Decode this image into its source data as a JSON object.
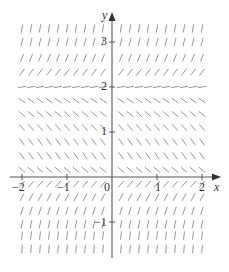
{
  "figure": {
    "type": "slope-field",
    "axes": {
      "x_label": "x",
      "y_label": "y",
      "x_ticks": [
        {
          "value": -2,
          "label": "−2"
        },
        {
          "value": -1,
          "label": "−1"
        },
        {
          "value": 0,
          "label": "0"
        },
        {
          "value": 1,
          "label": "1"
        },
        {
          "value": 2,
          "label": "2"
        }
      ],
      "y_ticks": [
        {
          "value": 3,
          "label": "3"
        },
        {
          "value": 2,
          "label": "2"
        },
        {
          "value": 1,
          "label": "1"
        },
        {
          "value": -1,
          "label": "−1"
        }
      ],
      "x_range": [
        -2.2,
        2.2
      ],
      "y_range": [
        -1.8,
        3.6
      ]
    },
    "equilibrium_y": 2,
    "colors": {
      "axis": "#555555",
      "segment": "#8a8a8a",
      "text": "#333333"
    },
    "rows": [
      {
        "y": 3.3,
        "angle_deg": 80
      },
      {
        "y": 3.0,
        "angle_deg": 76
      },
      {
        "y": 2.65,
        "angle_deg": 68
      },
      {
        "y": 2.33,
        "angle_deg": 52
      },
      {
        "y": 2.0,
        "angle_deg": 8
      },
      {
        "y": 1.7,
        "angle_deg": -35
      },
      {
        "y": 1.4,
        "angle_deg": -40
      },
      {
        "y": 1.1,
        "angle_deg": -48
      },
      {
        "y": 0.78,
        "angle_deg": -55
      },
      {
        "y": 0.47,
        "angle_deg": -55
      },
      {
        "y": 0.16,
        "angle_deg": -40
      },
      {
        "y": -0.16,
        "angle_deg": 48
      },
      {
        "y": -0.45,
        "angle_deg": 62
      },
      {
        "y": -0.75,
        "angle_deg": 72
      },
      {
        "y": -1.05,
        "angle_deg": 78
      },
      {
        "y": -1.3,
        "angle_deg": 82
      },
      {
        "y": -1.6,
        "angle_deg": 85
      }
    ]
  }
}
